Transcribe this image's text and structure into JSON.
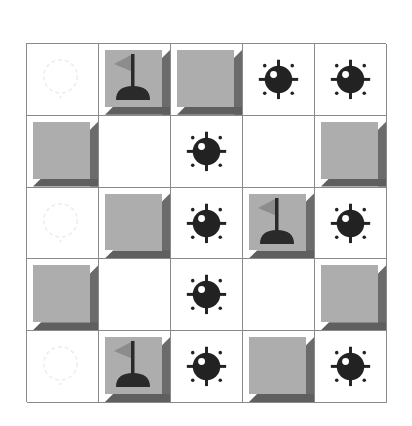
{
  "board": {
    "rows": 5,
    "cols": 5,
    "colors": {
      "grid_line": "#8a8a8a",
      "tile_face": "#adadad",
      "tile_bevel": "#6b6b6b",
      "mine": "#222222",
      "flag": "#8c8c8c",
      "flag_base": "#2a2a2a",
      "ghost": "#eeeeee"
    },
    "cells": [
      [
        "ghost",
        "flag",
        "covered",
        "mine",
        "mine"
      ],
      [
        "covered",
        "empty",
        "mine",
        "empty",
        "covered"
      ],
      [
        "ghost",
        "covered",
        "mine",
        "flag",
        "mine"
      ],
      [
        "covered",
        "empty",
        "mine",
        "empty",
        "covered"
      ],
      [
        "ghost",
        "flag",
        "mine",
        "covered",
        "mine"
      ]
    ],
    "icons": {
      "mine": "mine-icon",
      "flag": "flag-icon",
      "ghost": "faint-mine-outline-icon",
      "covered": "covered-tile",
      "empty": "revealed-empty"
    }
  }
}
